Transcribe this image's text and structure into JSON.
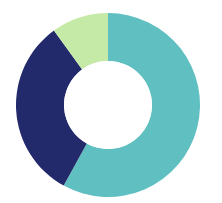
{
  "chart_data": {
    "type": "pie",
    "variant": "donut",
    "title": "",
    "categories": [
      "Segment A",
      "Segment B",
      "Segment C"
    ],
    "values": [
      58,
      32,
      10
    ],
    "colors": [
      "#5fbfc1",
      "#232a6b",
      "#c5eaa8"
    ],
    "start_angle_deg": 0,
    "direction": "clockwise",
    "legend": null,
    "labels_visible": false
  },
  "layout": {
    "center_x": 108,
    "center_y": 105,
    "outer_radius": 92,
    "inner_radius": 44,
    "background": "#ffffff"
  }
}
